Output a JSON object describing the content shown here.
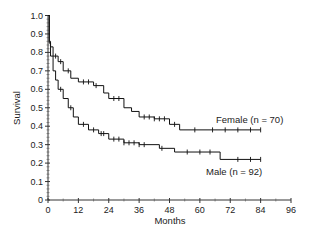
{
  "chart_data": {
    "type": "line",
    "subtype": "kaplan-meier-step",
    "title": "",
    "xlabel": "Months",
    "ylabel": "Survival",
    "xlim": [
      0,
      96
    ],
    "ylim": [
      0,
      1.0
    ],
    "x_ticks": [
      "0",
      "12",
      "24",
      "36",
      "48",
      "60",
      "72",
      "84",
      "96"
    ],
    "y_ticks": [
      "0",
      "0.1",
      "0.2",
      "0.3",
      "0.4",
      "0.5",
      "0.6",
      "0.7",
      "0.8",
      "0.9",
      "1.0"
    ],
    "grid": false,
    "legend_position": "inline-labels",
    "series": [
      {
        "name": "Female (n = 70)",
        "steps": [
          [
            0,
            1.0
          ],
          [
            0.5,
            0.86
          ],
          [
            1,
            0.83
          ],
          [
            2,
            0.78
          ],
          [
            4,
            0.75
          ],
          [
            6,
            0.7
          ],
          [
            9,
            0.66
          ],
          [
            12,
            0.64
          ],
          [
            18,
            0.62
          ],
          [
            22,
            0.58
          ],
          [
            24,
            0.55
          ],
          [
            30,
            0.5
          ],
          [
            33,
            0.48
          ],
          [
            36,
            0.45
          ],
          [
            42,
            0.44
          ],
          [
            48,
            0.41
          ],
          [
            52,
            0.38
          ],
          [
            84,
            0.38
          ]
        ],
        "censor_marks": [
          3,
          5,
          8,
          14,
          16,
          19,
          26,
          28,
          38,
          40,
          42,
          44,
          46,
          50,
          58,
          65,
          70,
          75,
          80,
          84
        ]
      },
      {
        "name": "Male (n = 92)",
        "steps": [
          [
            0,
            1.0
          ],
          [
            0.5,
            0.85
          ],
          [
            1,
            0.78
          ],
          [
            2,
            0.7
          ],
          [
            3,
            0.65
          ],
          [
            4,
            0.6
          ],
          [
            6,
            0.55
          ],
          [
            8,
            0.5
          ],
          [
            10,
            0.45
          ],
          [
            12,
            0.41
          ],
          [
            16,
            0.38
          ],
          [
            20,
            0.36
          ],
          [
            24,
            0.33
          ],
          [
            30,
            0.31
          ],
          [
            36,
            0.3
          ],
          [
            44,
            0.28
          ],
          [
            50,
            0.26
          ],
          [
            68,
            0.22
          ],
          [
            84,
            0.22
          ]
        ],
        "censor_marks": [
          5,
          9,
          14,
          18,
          21,
          22,
          26,
          28,
          30,
          32,
          34,
          36,
          38,
          45,
          55,
          60,
          64,
          75,
          80,
          84
        ]
      }
    ]
  },
  "labels": {
    "female": "Female (n = 70)",
    "male": "Male (n = 92)",
    "xlabel": "Months",
    "ylabel": "Survival"
  }
}
